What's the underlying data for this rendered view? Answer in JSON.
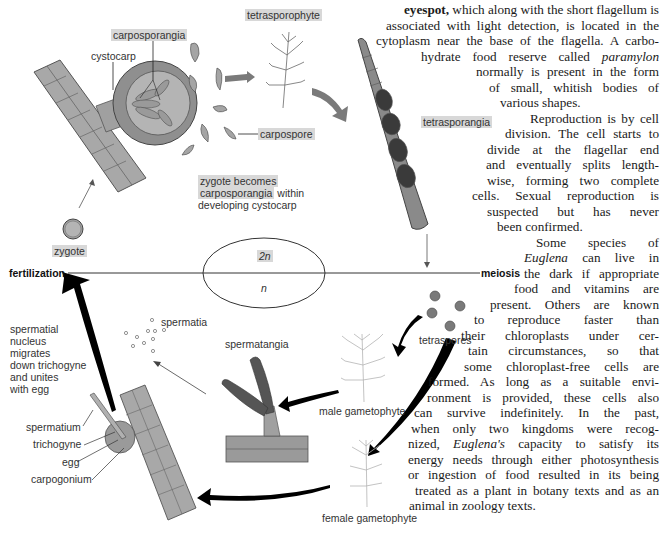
{
  "figure": {
    "type": "life cycle diagram",
    "ploidy": {
      "diploid": "2n",
      "haploid": "n"
    },
    "stage_labels": {
      "fertilization": "fertilization",
      "meiosis": "meiosis"
    },
    "labels": {
      "tetrasporophyte": "tetrasporophyte",
      "carposporangia": "carposporangia",
      "cystocarp": "cystocarp",
      "carpospore": "carpospore",
      "tetrasporangia": "tetrasporangia",
      "zygote_becomes_1": "zygote becomes",
      "zygote_becomes_2": "carposporangia",
      "zygote_becomes_3": " within",
      "zygote_becomes_4": "developing cystocarp",
      "zygote": "zygote",
      "spermatia": "spermatia",
      "spermatangia": "spermatangia",
      "tetraspores": "tetraspores",
      "male_gametophyte": "male gametophyte",
      "female_gametophyte": "female gametophyte",
      "spermatium": "spermatium",
      "trichogyne": "trichogyne",
      "egg": "egg",
      "carpogonium": "carpogonium",
      "nucleus_note": [
        "spermatial",
        "nucleus",
        "migrates",
        "down trichogyne",
        "and unites",
        "with egg"
      ]
    }
  },
  "body_text": {
    "lines": [
      {
        "parts": [
          {
            "b": "eyespot,"
          },
          {
            "t": " which along with the short flagellum is"
          }
        ]
      },
      {
        "parts": [
          {
            "t": "associated with light detection, is located in the"
          }
        ]
      },
      {
        "parts": [
          {
            "t": "cytoplasm near the base of the flagella. A carbo-"
          }
        ]
      },
      {
        "parts": [
          {
            "t": "hydrate food reserve called "
          },
          {
            "i": "paramylon"
          }
        ]
      },
      {
        "parts": [
          {
            "t": "normally is present in the form"
          }
        ]
      },
      {
        "parts": [
          {
            "t": "of small, whitish bodies of"
          }
        ]
      },
      {
        "parts": [
          {
            "t": "various shapes."
          }
        ]
      },
      {
        "parts": [
          {
            "t": "Reproduction is by cell"
          }
        ]
      },
      {
        "parts": [
          {
            "t": "division. The cell starts to"
          }
        ]
      },
      {
        "parts": [
          {
            "t": "divide at the flagellar end"
          }
        ]
      },
      {
        "parts": [
          {
            "t": "and eventually splits length-"
          }
        ]
      },
      {
        "parts": [
          {
            "t": "wise, forming two complete"
          }
        ]
      },
      {
        "parts": [
          {
            "t": "cells. Sexual reproduction is"
          }
        ]
      },
      {
        "parts": [
          {
            "t": "suspected but has never"
          }
        ]
      },
      {
        "parts": [
          {
            "t": "been confirmed."
          }
        ]
      },
      {
        "parts": [
          {
            "t": "Some species of"
          }
        ]
      },
      {
        "parts": [
          {
            "i": "Euglena"
          },
          {
            "t": " can live in"
          }
        ]
      },
      {
        "parts": [
          {
            "t": "the dark if appropriate"
          }
        ]
      },
      {
        "parts": [
          {
            "t": "food and vitamins are"
          }
        ]
      },
      {
        "parts": [
          {
            "t": "present. Others are known"
          }
        ]
      },
      {
        "parts": [
          {
            "t": "to reproduce faster than"
          }
        ]
      },
      {
        "parts": [
          {
            "t": "their chloroplasts under cer-"
          }
        ]
      },
      {
        "parts": [
          {
            "t": "tain circumstances, so that"
          }
        ]
      },
      {
        "parts": [
          {
            "t": "some chloroplast-free cells are"
          }
        ]
      },
      {
        "parts": [
          {
            "t": "formed. As long as a suitable envi-"
          }
        ]
      },
      {
        "parts": [
          {
            "t": "ronment is provided, these cells also"
          }
        ]
      },
      {
        "parts": [
          {
            "t": "can survive indefinitely. In the past,"
          }
        ]
      },
      {
        "parts": [
          {
            "t": "when only two kingdoms were recog-"
          }
        ]
      },
      {
        "parts": [
          {
            "t": "nized, "
          },
          {
            "i": "Euglena's"
          },
          {
            "t": " capacity to satisfy its"
          }
        ]
      },
      {
        "parts": [
          {
            "t": "energy needs through either photosynthesis"
          }
        ]
      },
      {
        "parts": [
          {
            "t": "or ingestion of food resulted in its being"
          }
        ]
      },
      {
        "parts": [
          {
            "t": "treated as a plant in botany texts and as an"
          }
        ]
      },
      {
        "parts": [
          {
            "t": "animal in zoology texts."
          }
        ]
      }
    ]
  }
}
